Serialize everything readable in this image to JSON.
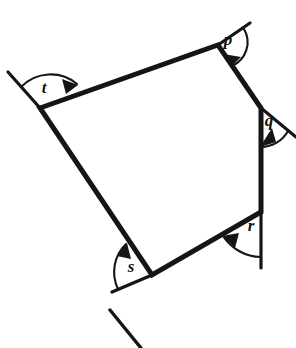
{
  "figure": {
    "type": "geometry-diagram",
    "canvas": {
      "width": 296,
      "height": 348
    },
    "colors": {
      "stroke": "#151515",
      "label": "#111111",
      "background": "#ffffff"
    },
    "polygon": {
      "name": "quadrilateral",
      "sides": 4,
      "vertices": [
        {
          "id": "T",
          "label": "t",
          "x": 40,
          "y": 108
        },
        {
          "id": "P",
          "label": "p",
          "x": 218,
          "y": 45
        },
        {
          "id": "Q",
          "label": "q",
          "x": 261,
          "y": 108
        },
        {
          "id": "R",
          "label": "r",
          "x": 261,
          "y": 212
        },
        {
          "id": "S",
          "label": "s",
          "x": 152,
          "y": 275
        }
      ],
      "path": "M 40 108 L 218 45 L 261 108 L 261 212 L 152 275 Z"
    },
    "extensions": [
      {
        "id": "ext-p",
        "at": "P",
        "from_x": 218,
        "from_y": 45,
        "to_x": 250,
        "to_y": 23
      },
      {
        "id": "ext-q",
        "at": "Q",
        "from_x": 261,
        "from_y": 108,
        "to_x": 296,
        "to_y": 137
      },
      {
        "id": "ext-r",
        "at": "R",
        "from_x": 261,
        "from_y": 212,
        "to_x": 261,
        "to_y": 268
      },
      {
        "id": "ext-s",
        "at": "S",
        "from_x": 152,
        "from_y": 275,
        "to_x": 112,
        "to_y": 292
      },
      {
        "id": "ext-t",
        "at": "T",
        "from_x": 40,
        "from_y": 108,
        "to_x": 8,
        "to_y": 72
      }
    ],
    "detached_segment": {
      "id": "stray-segment",
      "x1": 110,
      "y1": 310,
      "x2": 141,
      "y2": 348
    },
    "angles": [
      {
        "id": "p",
        "label": "p",
        "vertex": "P",
        "label_x": 228,
        "label_y": 41,
        "arc_path": "M 244 29 A 26 26 0 0 1 232 66",
        "arrow_points": "232,66 224,55 240,58"
      },
      {
        "id": "q",
        "label": "q",
        "vertex": "Q",
        "label_x": 269,
        "label_y": 122,
        "arc_path": "M 287 130 A 30 30 0 0 1 261 146",
        "arrow_points": "261,146 275,141 272,128"
      },
      {
        "id": "r",
        "label": "r",
        "vertex": "R",
        "label_x": 251,
        "label_y": 227,
        "arc_path": "M 261 256 A 44 44 0 0 1 224 236",
        "arrow_points": "224,236 239,234 236,247"
      },
      {
        "id": "s",
        "label": "s",
        "vertex": "S",
        "label_x": 131,
        "label_y": 268,
        "arc_path": "M 119 288 A 38 38 0 0 1 126 245",
        "arrow_points": "126,245 131,259 118,257"
      },
      {
        "id": "t",
        "label": "t",
        "vertex": "T",
        "label_x": 44,
        "label_y": 89,
        "arc_path": "M 22 88 A 40 40 0 0 1 76 84",
        "arrow_points": "76,84 62,80 66,93"
      }
    ],
    "labels": {
      "p": "p",
      "q": "q",
      "r": "r",
      "s": "s",
      "t": "t"
    }
  }
}
